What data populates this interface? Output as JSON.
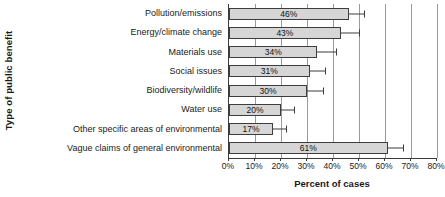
{
  "chart_data": {
    "type": "bar",
    "orientation": "horizontal",
    "title": "",
    "xlabel": "Percent of cases",
    "ylabel": "Type of public benefit",
    "xlim": [
      0,
      80
    ],
    "xticks": [
      "0%",
      "10%",
      "20%",
      "30%",
      "40%",
      "50%",
      "60%",
      "70%",
      "80%"
    ],
    "xtick_values": [
      0,
      10,
      20,
      30,
      40,
      50,
      60,
      70,
      80
    ],
    "grid": true,
    "legend": "none",
    "categories": [
      "Pollution/emissions",
      "Energy/climate change",
      "Materials use",
      "Social issues",
      "Biodiversity/wildlife",
      "Water use",
      "Other specific areas of environmental",
      "Vague claims of general environmental"
    ],
    "values": [
      46,
      43,
      34,
      31,
      30,
      20,
      17,
      61
    ],
    "value_labels": [
      "46%",
      "43%",
      "34%",
      "31%",
      "30%",
      "20%",
      "17%",
      "61%"
    ],
    "error_high": [
      52,
      50,
      41,
      37,
      36,
      25,
      22,
      67
    ]
  },
  "bar_style": {
    "fill": "#d6d6d6",
    "border": "#3d3d3d",
    "gridline": "#9a9a9a",
    "axis": "#3a3a3a"
  }
}
